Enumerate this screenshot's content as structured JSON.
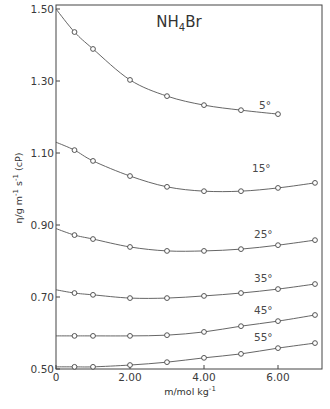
{
  "chart_data": {
    "type": "line",
    "title": "NH4Br",
    "title_main": "NH",
    "title_sub": "4",
    "title_tail": "Br",
    "xlabel": "m/mol kg-1",
    "ylabel": "η/g m-1 s-1 (cP)",
    "xlim": [
      0,
      7.2
    ],
    "ylim": [
      0.49,
      1.51
    ],
    "x_ticks": [
      0,
      2,
      4,
      6
    ],
    "x_tick_labels": [
      "0",
      "2.00",
      "4.00",
      "6.00"
    ],
    "y_ticks": [
      0.5,
      0.7,
      0.9,
      1.1,
      1.3,
      1.5
    ],
    "y_tick_labels": [
      "0.50",
      "0.70",
      "0.90",
      "1.10",
      "1.30",
      "1.50"
    ],
    "grid": false,
    "legend": "inline labels at right end of each curve",
    "series": [
      {
        "name": "5°",
        "label": "5°",
        "x": [
          0,
          0.5,
          1.0,
          2.0,
          3.0,
          4.0,
          5.0,
          6.0
        ],
        "values": [
          1.5,
          1.436,
          1.389,
          1.303,
          1.258,
          1.233,
          1.219,
          1.208
        ],
        "marker_from_index": 1
      },
      {
        "name": "15°",
        "label": "15°",
        "x": [
          0,
          0.5,
          1.0,
          2.0,
          3.0,
          4.0,
          5.0,
          6.0,
          7.0
        ],
        "values": [
          1.13,
          1.108,
          1.078,
          1.036,
          1.006,
          0.994,
          0.994,
          1.003,
          1.017
        ],
        "marker_from_index": 1
      },
      {
        "name": "25°",
        "label": "25°",
        "x": [
          0,
          0.5,
          1.0,
          2.0,
          3.0,
          4.0,
          5.0,
          6.0,
          7.0
        ],
        "values": [
          0.89,
          0.872,
          0.861,
          0.839,
          0.828,
          0.828,
          0.833,
          0.844,
          0.858
        ],
        "marker_from_index": 1
      },
      {
        "name": "35°",
        "label": "35°",
        "x": [
          0,
          0.5,
          1.0,
          2.0,
          3.0,
          4.0,
          5.0,
          6.0,
          7.0
        ],
        "values": [
          0.72,
          0.711,
          0.706,
          0.697,
          0.697,
          0.703,
          0.711,
          0.722,
          0.736
        ],
        "marker_from_index": 1
      },
      {
        "name": "45°",
        "label": "45°",
        "x": [
          0,
          0.5,
          1.0,
          2.0,
          3.0,
          4.0,
          5.0,
          6.0,
          7.0
        ],
        "values": [
          0.592,
          0.592,
          0.592,
          0.592,
          0.594,
          0.603,
          0.619,
          0.633,
          0.65
        ],
        "marker_from_index": 1
      },
      {
        "name": "55°",
        "label": "55°",
        "x": [
          0,
          0.5,
          1.0,
          2.0,
          3.0,
          4.0,
          5.0,
          6.0,
          7.0
        ],
        "values": [
          0.506,
          0.506,
          0.506,
          0.511,
          0.519,
          0.531,
          0.542,
          0.558,
          0.572
        ],
        "marker_from_index": 1
      }
    ]
  }
}
